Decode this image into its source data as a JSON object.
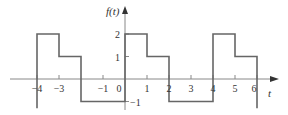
{
  "chart_data": {
    "type": "line",
    "title": "",
    "xlabel": "t",
    "ylabel": "f(t)",
    "x_ticks": [
      -4,
      -3,
      -1,
      0,
      1,
      2,
      3,
      4,
      5,
      6
    ],
    "y_ticks": [
      2,
      1,
      -1
    ],
    "xlim": [
      -4.8,
      7
    ],
    "ylim": [
      -1.5,
      3.2
    ],
    "segments": [
      {
        "t_start": -4,
        "t_end": -3,
        "value": 2
      },
      {
        "t_start": -3,
        "t_end": -2,
        "value": 1
      },
      {
        "t_start": -2,
        "t_end": 0,
        "value": -1
      },
      {
        "t_start": 0,
        "t_end": 1,
        "value": 2
      },
      {
        "t_start": 1,
        "t_end": 2,
        "value": 1
      },
      {
        "t_start": 2,
        "t_end": 4,
        "value": -1
      },
      {
        "t_start": 4,
        "t_end": 5,
        "value": 2
      },
      {
        "t_start": 5,
        "t_end": 6,
        "value": 1
      }
    ],
    "x": [
      -4,
      -4,
      -3,
      -3,
      -2,
      -2,
      0,
      0,
      1,
      1,
      2,
      2,
      4,
      4,
      5,
      5,
      6,
      6
    ],
    "values": [
      -1.3,
      2,
      2,
      1,
      1,
      -1,
      -1,
      2,
      2,
      1,
      1,
      -1,
      -1,
      2,
      2,
      1,
      1,
      -1.3
    ],
    "line_color": "#666666",
    "axis_color": "#888888",
    "grid": false,
    "legend": null
  },
  "labels": {
    "ylabel": "f(t)",
    "xlabel": "t",
    "x_tick_labels": [
      "−4",
      "−3",
      "−1",
      "0",
      "1",
      "2",
      "3",
      "4",
      "5",
      "6"
    ],
    "y_tick_labels": [
      "2",
      "1",
      "−1"
    ]
  }
}
